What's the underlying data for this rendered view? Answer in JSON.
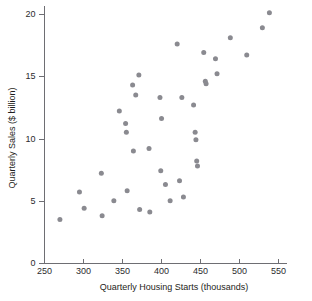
{
  "chart_data": {
    "type": "scatter",
    "title": "",
    "xlabel": "Quarterly Housing Starts (thousands)",
    "ylabel": "Quarterly Sales ($ billion)",
    "xlim": [
      250,
      550
    ],
    "ylim": [
      0,
      20
    ],
    "xticks": [
      250,
      300,
      350,
      400,
      450,
      500,
      550
    ],
    "yticks": [
      0,
      5,
      10,
      15,
      20
    ],
    "xtick_labels": [
      "250",
      "300",
      "350",
      "400",
      "450",
      "500",
      "550"
    ],
    "ytick_labels": [
      "0",
      "5",
      "10",
      "15",
      "20"
    ],
    "grid": false,
    "legend": null,
    "marker_color": "#8a8a90",
    "axis_color": "#6e6e73",
    "series": [
      {
        "name": "Quarterly data",
        "points": [
          [
            271,
            3.5
          ],
          [
            296,
            5.7
          ],
          [
            302,
            4.4
          ],
          [
            324,
            7.2
          ],
          [
            325,
            3.8
          ],
          [
            340,
            5.0
          ],
          [
            347,
            12.2
          ],
          [
            355,
            11.2
          ],
          [
            356,
            10.5
          ],
          [
            357,
            5.8
          ],
          [
            364,
            14.3
          ],
          [
            365,
            9.0
          ],
          [
            368,
            13.5
          ],
          [
            372,
            15.1
          ],
          [
            373,
            4.3
          ],
          [
            385,
            9.2
          ],
          [
            386,
            4.1
          ],
          [
            399,
            13.3
          ],
          [
            400,
            7.4
          ],
          [
            401,
            11.6
          ],
          [
            406,
            6.3
          ],
          [
            412,
            5.0
          ],
          [
            421,
            17.6
          ],
          [
            424,
            6.6
          ],
          [
            427,
            13.3
          ],
          [
            429,
            5.3
          ],
          [
            442,
            12.7
          ],
          [
            444,
            10.5
          ],
          [
            445,
            9.9
          ],
          [
            446,
            8.2
          ],
          [
            447,
            7.8
          ],
          [
            455,
            16.9
          ],
          [
            457,
            14.6
          ],
          [
            458,
            14.4
          ],
          [
            470,
            16.4
          ],
          [
            472,
            15.2
          ],
          [
            489,
            18.1
          ],
          [
            510,
            16.7
          ],
          [
            530,
            18.9
          ],
          [
            539,
            20.1
          ]
        ]
      }
    ]
  },
  "figure": {
    "axis_label_x": "Quarterly Housing Starts (thousands)",
    "axis_label_y": "Quarterly Sales ($ billion)"
  }
}
